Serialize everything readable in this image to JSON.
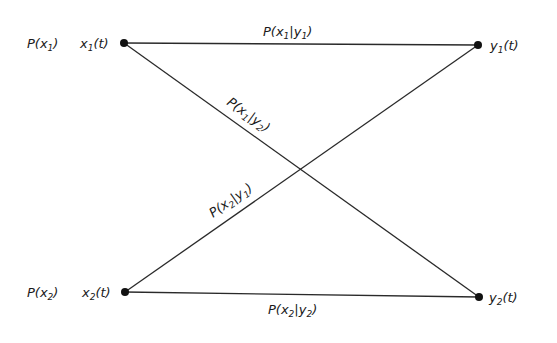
{
  "diagram": {
    "type": "binary-channel-transition-diagram",
    "inputs": [
      {
        "id": "x1",
        "prob_label": {
          "base": "P(x",
          "sub": "1",
          "tail": ")"
        },
        "signal_label": {
          "base": "x",
          "sub": "1",
          "tail": "(t)"
        }
      },
      {
        "id": "x2",
        "prob_label": {
          "base": "P(x",
          "sub": "2",
          "tail": ")"
        },
        "signal_label": {
          "base": "x",
          "sub": "2",
          "tail": "(t)"
        }
      }
    ],
    "outputs": [
      {
        "id": "y1",
        "signal_label": {
          "base": "y",
          "sub": "1",
          "tail": "(t)"
        }
      },
      {
        "id": "y2",
        "signal_label": {
          "base": "y",
          "sub": "2",
          "tail": "(t)"
        }
      }
    ],
    "edges": [
      {
        "from": "x1",
        "to": "y1",
        "label": {
          "a": "P(x",
          "a_sub": "1",
          "b": "|y",
          "b_sub": "1",
          "c": ")"
        }
      },
      {
        "from": "x1",
        "to": "y2",
        "label": {
          "a": "P(x",
          "a_sub": "1",
          "b": "|y",
          "b_sub": "2",
          "c": ")"
        }
      },
      {
        "from": "x2",
        "to": "y1",
        "label": {
          "a": "P(x",
          "a_sub": "2",
          "b": "|y",
          "b_sub": "1",
          "c": ")"
        }
      },
      {
        "from": "x2",
        "to": "y2",
        "label": {
          "a": "P(x",
          "a_sub": "2",
          "b": "|y",
          "b_sub": "2",
          "c": ")"
        }
      }
    ],
    "colors": {
      "line": "#2a2a2a",
      "node": "#111111",
      "text": "#1a1a1a",
      "background": "#ffffff"
    }
  }
}
